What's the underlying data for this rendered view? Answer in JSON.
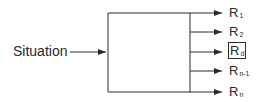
{
  "diagram": {
    "input_label": "Situation",
    "outputs": [
      {
        "base": "R",
        "sub": "1",
        "boxed": false
      },
      {
        "base": "R",
        "sub": "2",
        "boxed": false
      },
      {
        "base": "R",
        "sub": "d",
        "boxed": true
      },
      {
        "base": "R",
        "sub": "n-1",
        "boxed": false
      },
      {
        "base": "R",
        "sub": "n",
        "boxed": false
      }
    ],
    "line_color": "#2a2a2a"
  }
}
